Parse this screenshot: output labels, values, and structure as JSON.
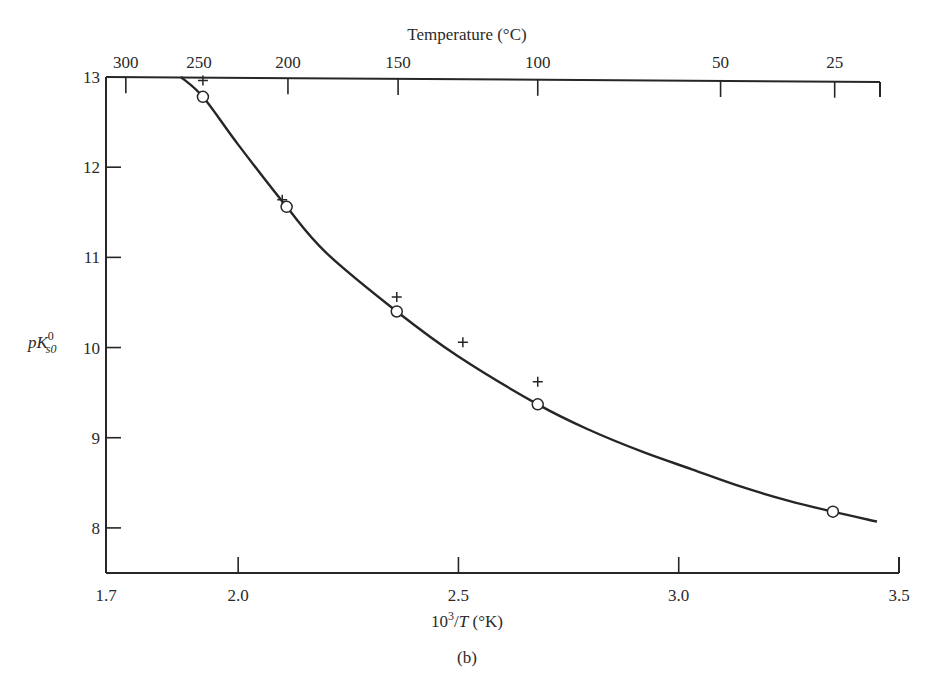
{
  "figure": {
    "caption": "(b)",
    "top_axis_title": "Temperature (°C)",
    "bottom_axis_title_base": "10",
    "bottom_axis_title_sup": "3",
    "bottom_axis_title_rest": "/T (°K)",
    "y_axis_title_p": "p",
    "y_axis_title_K": "K",
    "y_axis_title_sub": "s0",
    "y_axis_title_sup": "0"
  },
  "chart_data": {
    "type": "scatter",
    "title": "",
    "xlabel": "10^3/T (°K)",
    "ylabel": "pK_s0^0",
    "top_xlabel": "Temperature (°C)",
    "xlim": [
      1.7,
      3.5
    ],
    "ylim": [
      7.5,
      13
    ],
    "grid": false,
    "legend": null,
    "x_ticks": [
      1.7,
      2.0,
      2.5,
      3.0,
      3.5
    ],
    "x_tick_labels": [
      "1.7",
      "2.0",
      "2.5",
      "3.0",
      "3.5"
    ],
    "y_ticks": [
      8,
      9,
      10,
      11,
      12,
      13
    ],
    "y_tick_labels": [
      "8",
      "9",
      "10",
      "11",
      "12",
      "13"
    ],
    "top_ticks": [
      {
        "label": "300",
        "x": 1.745
      },
      {
        "label": "250",
        "x": 1.911
      },
      {
        "label": "200",
        "x": 2.113
      },
      {
        "label": "150",
        "x": 2.363
      },
      {
        "label": "100",
        "x": 2.68
      },
      {
        "label": "50",
        "x": 3.095
      },
      {
        "label": "25",
        "x": 3.354
      }
    ],
    "series": [
      {
        "name": "circles",
        "marker": "open-circle",
        "points": [
          {
            "x": 1.92,
            "y": 12.78
          },
          {
            "x": 2.11,
            "y": 11.56
          },
          {
            "x": 2.36,
            "y": 10.4
          },
          {
            "x": 2.68,
            "y": 9.37
          },
          {
            "x": 3.35,
            "y": 8.18
          }
        ]
      },
      {
        "name": "crosses",
        "marker": "plus",
        "points": [
          {
            "x": 1.92,
            "y": 12.96
          },
          {
            "x": 2.1,
            "y": 11.64
          },
          {
            "x": 2.36,
            "y": 10.56
          },
          {
            "x": 2.51,
            "y": 10.06
          },
          {
            "x": 2.68,
            "y": 9.62
          }
        ]
      },
      {
        "name": "fitted-curve",
        "marker": "line",
        "points": [
          {
            "x": 1.87,
            "y": 13.0
          },
          {
            "x": 1.92,
            "y": 12.78
          },
          {
            "x": 2.0,
            "y": 12.25
          },
          {
            "x": 2.11,
            "y": 11.56
          },
          {
            "x": 2.2,
            "y": 11.05
          },
          {
            "x": 2.36,
            "y": 10.4
          },
          {
            "x": 2.5,
            "y": 9.9
          },
          {
            "x": 2.68,
            "y": 9.37
          },
          {
            "x": 2.8,
            "y": 9.08
          },
          {
            "x": 2.92,
            "y": 8.84
          },
          {
            "x": 3.03,
            "y": 8.65
          },
          {
            "x": 3.14,
            "y": 8.46
          },
          {
            "x": 3.25,
            "y": 8.3
          },
          {
            "x": 3.35,
            "y": 8.18
          },
          {
            "x": 3.45,
            "y": 8.07
          }
        ]
      }
    ]
  }
}
